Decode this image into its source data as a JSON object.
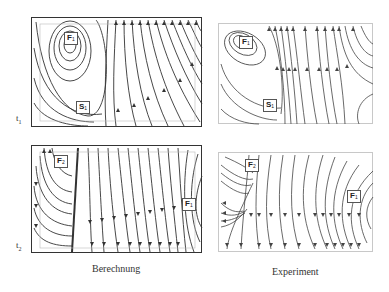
{
  "figure": {
    "panels": [
      {
        "id": "calc-t1",
        "column": "Berechnung",
        "time": "t1",
        "labels": [
          {
            "text": "F",
            "sub": "1",
            "x": 32,
            "y": 14
          },
          {
            "text": "S",
            "sub": "1",
            "x": 44,
            "y": 83
          }
        ]
      },
      {
        "id": "exp-t1",
        "column": "Experiment",
        "time": "t1",
        "labels": [
          {
            "text": "F",
            "sub": "1",
            "x": 20,
            "y": 12
          },
          {
            "text": "S",
            "sub": "1",
            "x": 44,
            "y": 75
          }
        ]
      },
      {
        "id": "calc-t2",
        "column": "Berechnung",
        "time": "t2",
        "labels": [
          {
            "text": "F",
            "sub": "2",
            "x": 22,
            "y": 9
          },
          {
            "text": "F",
            "sub": "1",
            "x": 150,
            "y": 52
          }
        ]
      },
      {
        "id": "exp-t2",
        "column": "Experiment",
        "time": "t2",
        "labels": [
          {
            "text": "F",
            "sub": "2",
            "x": 26,
            "y": 6
          },
          {
            "text": "F",
            "sub": "1",
            "x": 128,
            "y": 37
          }
        ]
      }
    ],
    "row_labels": [
      {
        "text": "t",
        "sub": "1"
      },
      {
        "text": "t",
        "sub": "2"
      }
    ],
    "captions": {
      "left": "Berechnung",
      "right": "Experiment"
    },
    "line_color": "#333333",
    "frame_color_calc": "#333333",
    "frame_color_exp": "#c8c8c8"
  }
}
